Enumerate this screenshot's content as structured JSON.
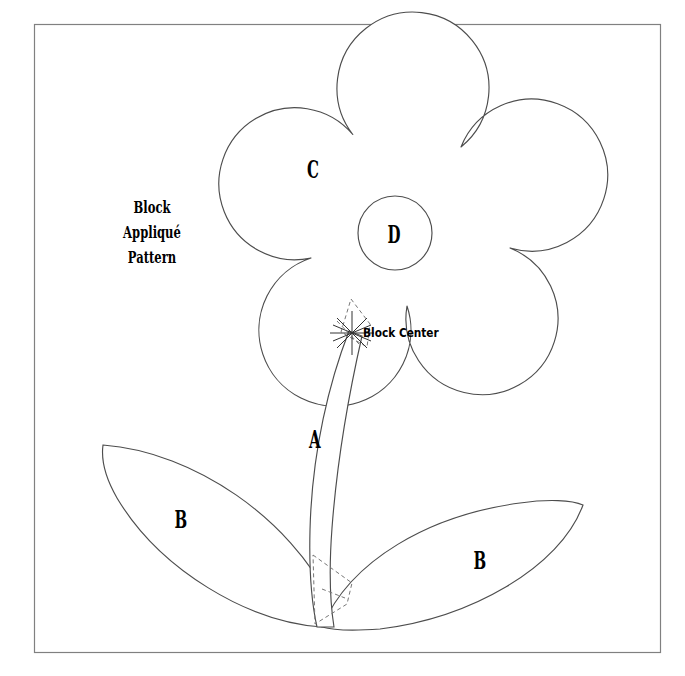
{
  "document": {
    "kind": "appliqué-quilt-block-pattern-sheet",
    "background_color": "#ffffff",
    "width": 685,
    "height": 676
  },
  "frame": {
    "name": "block-border",
    "stroke_color": "#808080",
    "x": 34,
    "y": 24,
    "width": 626,
    "height": 628
  },
  "title": {
    "line1": "Block",
    "line2": "Appliqué",
    "line3": "Pattern"
  },
  "annotations": {
    "block_center_label": "Block Center"
  },
  "pieces": [
    {
      "id": "A",
      "label": "A",
      "name": "stem-piece",
      "x": 315,
      "y": 439
    },
    {
      "id": "B-left",
      "label": "B",
      "name": "left-leaf-piece",
      "x": 181,
      "y": 519
    },
    {
      "id": "B-right",
      "label": "B",
      "name": "right-leaf-piece",
      "x": 480,
      "y": 560
    },
    {
      "id": "C",
      "label": "C",
      "name": "flower-petal-piece",
      "x": 313,
      "y": 169
    },
    {
      "id": "D",
      "label": "D",
      "name": "flower-center-piece",
      "x": 394,
      "y": 234
    }
  ],
  "colors": {
    "outline": "#4d4d4d",
    "frame": "#808080",
    "dashed_guide": "#777777",
    "text": "#000000"
  },
  "geometry": {
    "flower": {
      "center_x": 396,
      "center_y": 213,
      "petal_count": 5,
      "petal_radius": 76,
      "petal_orbit_radius": 86,
      "bbox": [
        230,
        58,
        565,
        368
      ]
    },
    "flower_center_circle": {
      "cx": 395,
      "cy": 233,
      "r": 37
    },
    "block_center_marker": {
      "x": 352,
      "y": 333,
      "ray_count": 8
    },
    "stem": {
      "top_x": 352,
      "top_y": 333,
      "bottom_x": 322,
      "bottom_y": 627
    },
    "left_leaf": {
      "tip_x": 103,
      "tip_y": 445,
      "base_x": 322,
      "base_y": 627
    },
    "right_leaf": {
      "tip_x": 583,
      "tip_y": 505,
      "base_x": 322,
      "base_y": 627
    }
  }
}
